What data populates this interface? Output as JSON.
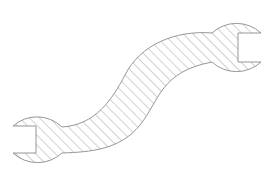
{
  "diagram": {
    "style": "cross-hatched section outline",
    "colors": {
      "background": "#ffffff",
      "outline": "#8a8a8a",
      "hatch": "#9a9a9a"
    },
    "hatch": {
      "angle_deg": 45,
      "spacing_px": 7
    },
    "parts": [
      {
        "name": "left-head",
        "label": "left open-end jaw"
      },
      {
        "name": "handle",
        "label": "S-curved handle"
      },
      {
        "name": "right-head",
        "label": "right open-end jaw"
      }
    ]
  }
}
